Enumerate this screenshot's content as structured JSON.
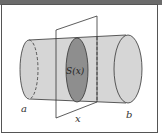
{
  "diagram": {
    "labels": {
      "left_end": "a",
      "right_end": "b",
      "position": "x",
      "cross_section": "S(x)"
    },
    "colors": {
      "frame": "#555555",
      "solid_fill": "#d6d6d6",
      "cross_section_fill": "#8e8e8e",
      "stroke": "#333333",
      "topbar": "#6b6b6b"
    }
  }
}
